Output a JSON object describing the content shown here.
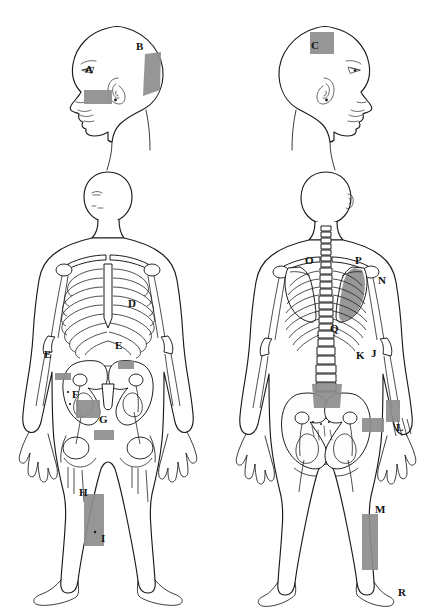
{
  "diagram": {
    "background_color": "#ffffff",
    "outline_color": "#1a1a1a",
    "marker_color": "#8d8d8d",
    "label_color": "#111111",
    "total_labels": 18
  },
  "figures": [
    {
      "id": "head-left",
      "name": "Left lateral head profile, facing left",
      "view": "lateral-left"
    },
    {
      "id": "head-right",
      "name": "Right lateral head profile, facing right",
      "view": "lateral-right"
    },
    {
      "id": "body-anterior",
      "name": "Anterior full body with skeletal overlay",
      "view": "anterior"
    },
    {
      "id": "body-posterior",
      "name": "Posterior full body with skeletal overlay",
      "view": "posterior"
    }
  ],
  "labels": {
    "A": "A",
    "B": "B",
    "C": "C",
    "D": "D",
    "E1": "E",
    "E2": "E",
    "F": "F",
    "G": "G",
    "H": "H",
    "I": "I",
    "J": "J",
    "K": "K",
    "L": "L",
    "M": "M",
    "N": "N",
    "O": "O",
    "P": "P",
    "Q": "Q",
    "R": "R"
  },
  "label_list": [
    {
      "letter": "A",
      "figure": "head-left",
      "region": "cheek / zygomatic-maxillary area",
      "has_marker": true
    },
    {
      "letter": "B",
      "figure": "head-left",
      "region": "occipital region",
      "has_marker": true
    },
    {
      "letter": "C",
      "figure": "head-right",
      "region": "frontal / forehead region",
      "has_marker": true
    },
    {
      "letter": "D",
      "figure": "body-anterior",
      "region": "left elbow region",
      "has_marker": false
    },
    {
      "letter": "E",
      "figure": "body-anterior",
      "region": "right hip / greater trochanter",
      "has_marker": true
    },
    {
      "letter": "E",
      "figure": "body-anterior",
      "region": "left hip / greater trochanter",
      "has_marker": true
    },
    {
      "letter": "F",
      "figure": "body-anterior",
      "region": "pubic / groin region",
      "has_marker": true
    },
    {
      "letter": "G",
      "figure": "body-anterior",
      "region": "medial distal thigh",
      "has_marker": true
    },
    {
      "letter": "H",
      "figure": "body-anterior",
      "region": "anterior shin, proximal",
      "has_marker": true
    },
    {
      "letter": "I",
      "figure": "body-anterior",
      "region": "anterior shin, distal",
      "has_marker": true
    },
    {
      "letter": "J",
      "figure": "body-posterior",
      "region": "lateral pelvis / iliac crest",
      "has_marker": true
    },
    {
      "letter": "K",
      "figure": "body-posterior",
      "region": "sacroiliac region",
      "has_marker": true
    },
    {
      "letter": "L",
      "figure": "body-posterior",
      "region": "hand / wrist dorsum",
      "has_marker": true
    },
    {
      "letter": "M",
      "figure": "body-posterior",
      "region": "posterior calf",
      "has_marker": true
    },
    {
      "letter": "N",
      "figure": "body-posterior",
      "region": "lateral scapular border",
      "has_marker": true
    },
    {
      "letter": "O",
      "figure": "body-posterior",
      "region": "right scapula",
      "has_marker": false
    },
    {
      "letter": "P",
      "figure": "body-posterior",
      "region": "left scapula",
      "has_marker": true
    },
    {
      "letter": "Q",
      "figure": "body-posterior",
      "region": "lumbar spine",
      "has_marker": true
    },
    {
      "letter": "R",
      "figure": "body-posterior",
      "region": "heel / calcaneus",
      "has_marker": false
    }
  ]
}
